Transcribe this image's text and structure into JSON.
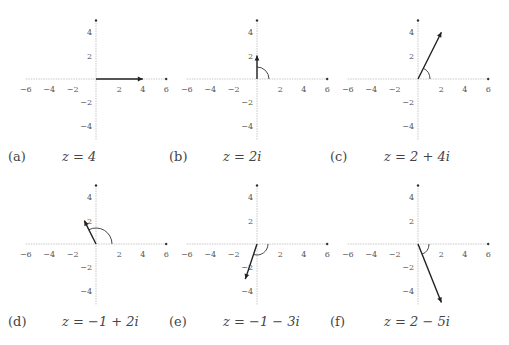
{
  "figure": {
    "axis_color": "#bbbbbb",
    "vector_color": "#222222",
    "arc_color": "#333333",
    "x_ticks": [
      -6,
      -4,
      -2,
      2,
      4,
      6
    ],
    "y_ticks": [
      4,
      2,
      -2,
      -4
    ],
    "panels": [
      {
        "id": "a",
        "label": "(a)",
        "equation": "z = 4",
        "re": 4,
        "im": 0,
        "arg_deg": 0
      },
      {
        "id": "b",
        "label": "(b)",
        "equation": "z = 2i",
        "re": 0,
        "im": 2,
        "arg_deg": 90
      },
      {
        "id": "c",
        "label": "(c)",
        "equation": "z = 2 + 4i",
        "re": 2,
        "im": 4,
        "arg_deg": 63.4
      },
      {
        "id": "d",
        "label": "(d)",
        "equation": "z = −1 + 2i",
        "re": -1,
        "im": 2,
        "arg_deg": 116.6
      },
      {
        "id": "e",
        "label": "(e)",
        "equation": "z = −1 − 3i",
        "re": -1,
        "im": -3,
        "arg_deg": -108.4
      },
      {
        "id": "f",
        "label": "(f)",
        "equation": "z =  2 − 5i",
        "re": 2,
        "im": -5,
        "arg_deg": -68.2
      }
    ]
  }
}
